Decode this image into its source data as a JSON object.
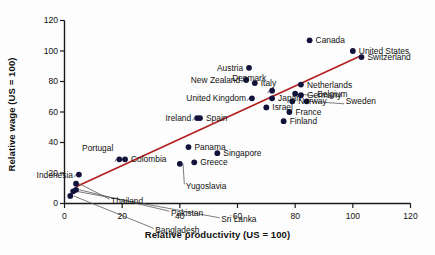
{
  "chart_data": {
    "type": "scatter",
    "title": "",
    "xlabel": "Relative productivity (US = 100)",
    "ylabel": "Relative wage (US = 100)",
    "xlim": [
      0,
      120
    ],
    "ylim": [
      0,
      120
    ],
    "xticks": [
      0,
      20,
      40,
      60,
      80,
      100,
      120
    ],
    "yticks": [
      0,
      20,
      40,
      60,
      80,
      100,
      120
    ],
    "grid": false,
    "legend": "none",
    "marker_color": "#12123c",
    "trendline_color": "#b32020",
    "axis_color": "#1a1a1a",
    "points": [
      {
        "label": "Bangladesh",
        "x": 2,
        "y": 5
      },
      {
        "label": "Sri Lanka",
        "x": 3,
        "y": 8
      },
      {
        "label": "Pakistan",
        "x": 4,
        "y": 9
      },
      {
        "label": "Thailand",
        "x": 4,
        "y": 13
      },
      {
        "label": "Indonesia",
        "x": 5,
        "y": 19
      },
      {
        "label": "Portugal",
        "x": 19,
        "y": 29
      },
      {
        "label": "Colombia",
        "x": 21,
        "y": 29
      },
      {
        "label": "Yugoslavia",
        "x": 40,
        "y": 26
      },
      {
        "label": "Panama",
        "x": 43,
        "y": 37
      },
      {
        "label": "Greece",
        "x": 45,
        "y": 27
      },
      {
        "label": "Ireland",
        "x": 46,
        "y": 56
      },
      {
        "label": "Spain",
        "x": 47,
        "y": 56
      },
      {
        "label": "Singapore",
        "x": 53,
        "y": 33
      },
      {
        "label": "United Kingdom",
        "x": 65,
        "y": 69
      },
      {
        "label": "New Zealand",
        "x": 63,
        "y": 81
      },
      {
        "label": "Austria",
        "x": 64,
        "y": 89
      },
      {
        "label": "Italy",
        "x": 66,
        "y": 79
      },
      {
        "label": "Israel",
        "x": 70,
        "y": 63
      },
      {
        "label": "Japan",
        "x": 72,
        "y": 69
      },
      {
        "label": "Denmark",
        "x": 72,
        "y": 74
      },
      {
        "label": "Finland",
        "x": 76,
        "y": 54
      },
      {
        "label": "France",
        "x": 78,
        "y": 60
      },
      {
        "label": "Norway",
        "x": 79,
        "y": 67
      },
      {
        "label": "Belgium",
        "x": 80,
        "y": 72
      },
      {
        "label": "Germany",
        "x": 82,
        "y": 71
      },
      {
        "label": "Netherlands",
        "x": 82,
        "y": 78
      },
      {
        "label": "Sweden",
        "x": 84,
        "y": 67
      },
      {
        "label": "Canada",
        "x": 85,
        "y": 107
      },
      {
        "label": "United States",
        "x": 100,
        "y": 100
      },
      {
        "label": "Switzerland",
        "x": 103,
        "y": 96
      }
    ],
    "trendline": {
      "x0": 4,
      "y0": 11,
      "x1": 103,
      "y1": 97
    }
  },
  "labels": {
    "austria": "Austria",
    "new_zealand": "New Zealand",
    "united_kingdom": "United Kingdom",
    "ireland": "Ireland",
    "spain": "Spain",
    "italy": "Italy",
    "japan": "Japan",
    "israel": "Israel",
    "denmark": "Denmark",
    "netherlands": "Netherlands",
    "belgium": "Belgium",
    "germany": "Germany",
    "norway": "Norway",
    "sweden": "Sweden",
    "france": "France",
    "finland": "Finland",
    "canada": "Canada",
    "united_states": "United States",
    "switzerland": "Switzerland",
    "portugal": "Portugal",
    "indonesia": "Indonesia",
    "colombia": "Colombia",
    "panama": "Panama",
    "greece": "Greece",
    "singapore": "Singapore",
    "yugoslavia": "Yugoslavia",
    "thailand": "Thailand",
    "pakistan": "Pakistan",
    "sri_lanka": "Sri Lanka",
    "bangladesh": "Bangladesh"
  },
  "ticks": {
    "x": [
      "0",
      "20",
      "40",
      "60",
      "80",
      "100",
      "120"
    ],
    "y": [
      "0",
      "20",
      "40",
      "60",
      "80",
      "100",
      "120"
    ]
  }
}
